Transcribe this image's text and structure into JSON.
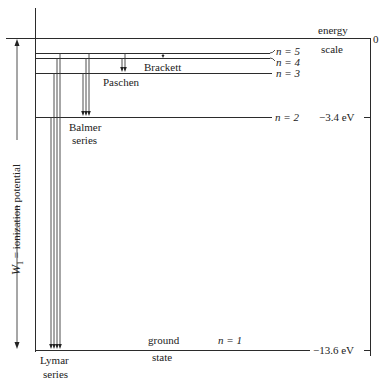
{
  "energy_scale": {
    "label_line1": "energy",
    "label_line2": "scale",
    "zero_label": "0",
    "n2_value": "−3.4 eV",
    "n1_value": "−13.6 eV"
  },
  "levels": [
    {
      "n": 5,
      "label": "n = 5"
    },
    {
      "n": 4,
      "label": "n = 4"
    },
    {
      "n": 3,
      "label": "n = 3"
    },
    {
      "n": 2,
      "label": "n = 2"
    },
    {
      "n": 1,
      "label": "n = 1"
    }
  ],
  "ground_state": {
    "line1": "ground",
    "line2": "state"
  },
  "series": {
    "lyman": {
      "line1": "Lymar",
      "line2": "series"
    },
    "balmer": {
      "line1": "Balmer",
      "line2": "series"
    },
    "paschen": {
      "label": "Paschen"
    },
    "brackett": {
      "label": "Brackett"
    }
  },
  "ionization": {
    "symbol": "W",
    "subscript": "1",
    "text": "= ionization potential"
  }
}
